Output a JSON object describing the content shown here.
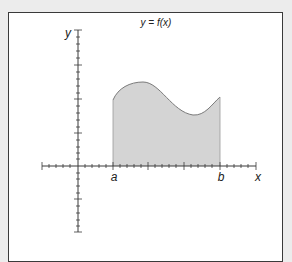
{
  "diagram": {
    "title": "y = f(x)",
    "axis_labels": {
      "x": "x",
      "y": "y"
    },
    "bound_labels": {
      "lower": "a",
      "upper": "b"
    },
    "colors": {
      "fill": "#d4d4d4",
      "curve": "#7a7a7a",
      "axis": "#3a3a3a",
      "border": "#3a3a3a",
      "background": "#ffffff"
    }
  }
}
